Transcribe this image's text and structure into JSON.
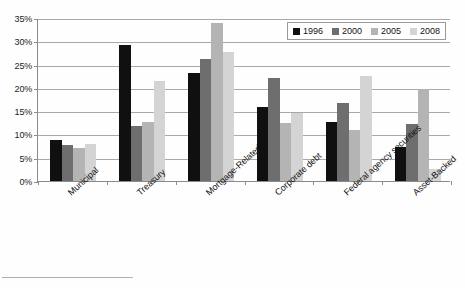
{
  "chart_data": {
    "type": "bar",
    "title": "",
    "subtitle": "",
    "xlabel": "",
    "ylabel": "",
    "ylim": [
      0,
      35
    ],
    "ytick_step": 5,
    "ytick_labels": [
      "0%",
      "5%",
      "10%",
      "15%",
      "20%",
      "25%",
      "30%",
      "35%"
    ],
    "ytick_values": [
      0,
      5,
      10,
      15,
      20,
      25,
      30,
      35
    ],
    "grid": true,
    "legend_position": "top-right",
    "value_unit": "%",
    "categories": [
      "Municipal",
      "Treasury",
      "Mortgage-Related",
      "Corporate debt",
      "Federal agency securities",
      "Asset-Backed"
    ],
    "series": [
      {
        "name": "1996",
        "color": "#101010",
        "values": [
          8.8,
          29.2,
          23.3,
          16.0,
          12.7,
          7.2
        ]
      },
      {
        "name": "2000",
        "color": "#6e6e6e",
        "values": [
          7.7,
          11.9,
          26.3,
          22.2,
          16.7,
          12.3
        ]
      },
      {
        "name": "2005",
        "color": "#b4b4b4",
        "values": [
          7.0,
          12.7,
          34.0,
          12.5,
          11.0,
          19.7
        ]
      },
      {
        "name": "2008",
        "color": "#d4d4d4",
        "values": [
          8.0,
          21.4,
          27.8,
          14.5,
          22.5,
          2.5
        ]
      }
    ]
  },
  "colors": {
    "axis": "#8a8a8a",
    "gridline": "#a9a9a9",
    "text": "#111111",
    "background": "#fefefe",
    "legend_border": "#9a9a9a"
  }
}
